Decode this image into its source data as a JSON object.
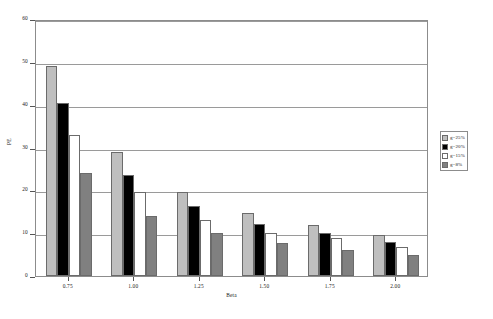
{
  "chart_data": {
    "type": "bar",
    "title": "",
    "subtitle": "",
    "xlabel": "Beta",
    "ylabel": "PE",
    "categories": [
      "0.75",
      "1.00",
      "1.25",
      "1.50",
      "1.75",
      "2.00"
    ],
    "series": [
      {
        "name": "g=25%",
        "color": "#bfbfbf",
        "values": [
          49.0,
          29.0,
          19.7,
          14.8,
          12.0,
          9.5
        ]
      },
      {
        "name": "g=20%",
        "color": "#000000",
        "values": [
          40.5,
          23.5,
          16.3,
          12.2,
          10.0,
          8.0
        ]
      },
      {
        "name": "g=15%",
        "color": "#ffffff",
        "values": [
          33.0,
          19.5,
          13.0,
          10.0,
          8.8,
          6.7
        ]
      },
      {
        "name": "g=8%",
        "color": "#808080",
        "values": [
          24.0,
          14.0,
          10.0,
          7.8,
          6.0,
          5.0
        ]
      }
    ],
    "ylim": [
      0,
      60
    ],
    "yticks": [
      0,
      10,
      20,
      30,
      40,
      50,
      60
    ],
    "ytick_labels": [
      "0",
      "10",
      "20",
      "30",
      "40",
      "50",
      "60"
    ],
    "grid": true,
    "grid_axis": "y",
    "legend_position": "right",
    "bar_border_color": "#6b6b6b",
    "plot_border_color": "#8c8c8c"
  },
  "legend": {
    "items": [
      {
        "label": "g=25%"
      },
      {
        "label": "g=20%"
      },
      {
        "label": "g=15%"
      },
      {
        "label": "g=8%"
      }
    ]
  },
  "axes": {
    "y_title": "PE",
    "x_title": "Beta"
  }
}
